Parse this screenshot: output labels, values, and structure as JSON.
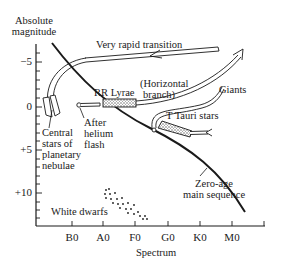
{
  "diagram": {
    "type": "Hertzsprung-Russell evolutionary diagram",
    "y_axis": {
      "title_line1": "Absolute",
      "title_line2": "magnitude",
      "ticks": [
        "−5",
        "0",
        "+5",
        "+10"
      ]
    },
    "x_axis": {
      "title": "Spectrum",
      "ticks": [
        "B0",
        "A0",
        "F0",
        "G0",
        "K0",
        "M0"
      ]
    },
    "labels": {
      "very_rapid_transition": "Very rapid transition",
      "rr_lyrae": "RR Lyrae",
      "horizontal_branch_1": "(Horizontal",
      "horizontal_branch_2": "branch)",
      "giants": "Giants",
      "t_tauri": "T Tauri stars",
      "after_helium_1": "After",
      "after_helium_2": "helium",
      "after_helium_3": "flash",
      "central_1": "Central",
      "central_2": "stars of",
      "central_3": "planetary",
      "central_4": "nebulae",
      "zero_age_1": "Zero-age",
      "zero_age_2": "main sequence",
      "white_dwarfs": "White dwarfs"
    },
    "colors": {
      "ink": "#1a1a1a",
      "background": "#ffffff",
      "shading": "#8a8a8a"
    }
  }
}
